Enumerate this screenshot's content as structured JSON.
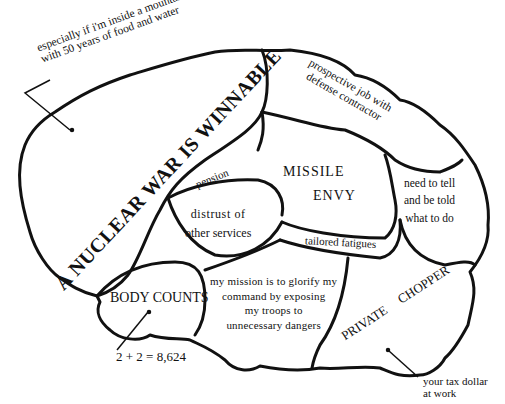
{
  "diagram": {
    "type": "brain-map-cartoon",
    "regions": [
      {
        "id": "nuclear-war",
        "label": "A NUCLEAR WAR IS WINNABLE"
      },
      {
        "id": "prospective-job",
        "label": "prospective job with defense contractor",
        "lines": [
          "prospective job with",
          "defense contractor"
        ]
      },
      {
        "id": "missile-envy",
        "label": "MISSILE ENVY",
        "lines": [
          "MISSILE",
          "ENVY"
        ]
      },
      {
        "id": "pension",
        "label": "pension"
      },
      {
        "id": "distrust",
        "label": "distrust of other services",
        "lines": [
          "distrust of",
          "other services"
        ]
      },
      {
        "id": "need-to-tell",
        "label": "need to tell and be told what to do",
        "lines": [
          "need to tell",
          "and be told",
          "what to do"
        ]
      },
      {
        "id": "tailored-fatigues",
        "label": "tailored fatigues"
      },
      {
        "id": "body-counts",
        "label": "BODY COUNTS"
      },
      {
        "id": "my-mission",
        "label": "my mission is to glorify my command by exposing my troops to unnecessary dangers",
        "lines": [
          "my mission is to glorify my",
          "command by exposing",
          "my troops to",
          "unnecessary dangers"
        ]
      },
      {
        "id": "private-chopper",
        "label": "PRIVATE CHOPPER"
      }
    ],
    "annotations": [
      {
        "id": "mountain-note",
        "lines": [
          "especially if i'm inside a mountain",
          "with 50 years of food and water"
        ]
      },
      {
        "id": "math-note",
        "label": "2 + 2 = 8,624"
      },
      {
        "id": "tax-note",
        "lines": [
          "your tax dollar",
          "at work"
        ]
      }
    ]
  }
}
